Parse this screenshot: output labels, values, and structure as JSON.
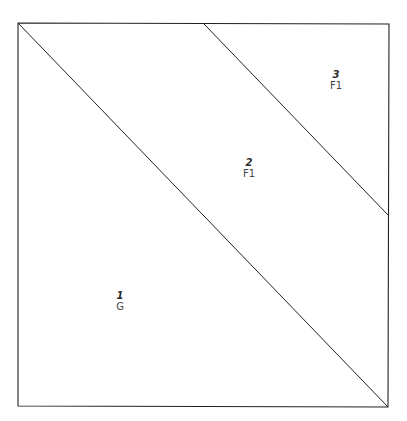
{
  "diagram": {
    "type": "quilt-block-piecing-diagram",
    "stroke_color": "#222222",
    "background_color": "#ffffff",
    "frame": {
      "top_left": [
        18,
        23
      ],
      "top_right": [
        389,
        24
      ],
      "bottom_right": [
        388,
        407
      ],
      "bottom_left": [
        18,
        406
      ]
    },
    "lines": [
      {
        "from": [
          18,
          23
        ],
        "to": [
          388,
          407
        ]
      },
      {
        "from": [
          204,
          24
        ],
        "to": [
          388,
          215
        ]
      }
    ],
    "regions": [
      {
        "number": "1",
        "code": "G",
        "x": 120,
        "y": 290
      },
      {
        "number": "2",
        "code": "F1",
        "x": 249,
        "y": 157
      },
      {
        "number": "3",
        "code": "F1",
        "x": 336,
        "y": 69
      }
    ]
  }
}
